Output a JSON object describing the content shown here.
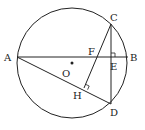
{
  "diagram": {
    "stroke": "#222222",
    "circle": {
      "cx": 72,
      "cy": 63,
      "r": 55
    },
    "center": {
      "label": "O",
      "x": 72,
      "y": 63,
      "lx": 62,
      "ly": 77
    },
    "points": {
      "A": {
        "x": 17,
        "y": 57,
        "lx": 4,
        "ly": 61
      },
      "B": {
        "x": 128,
        "y": 57,
        "lx": 130,
        "ly": 61
      },
      "C": {
        "x": 111,
        "y": 24,
        "lx": 110,
        "ly": 21
      },
      "D": {
        "x": 111,
        "y": 104,
        "lx": 110,
        "ly": 116
      },
      "E": {
        "x": 111,
        "y": 57,
        "lx": 110,
        "ly": 70
      },
      "F": {
        "x": 95,
        "y": 57,
        "lx": 88,
        "ly": 55
      },
      "H": {
        "x": 84,
        "y": 88,
        "lx": 73,
        "ly": 99
      }
    },
    "labels": [
      "A",
      "B",
      "C",
      "D",
      "E",
      "F",
      "H",
      "O"
    ]
  }
}
